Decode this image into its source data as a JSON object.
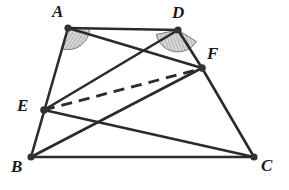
{
  "figure": {
    "type": "geometry-diagram",
    "width": 289,
    "height": 190,
    "background_color": "#ffffff",
    "stroke_color": "#2b2b2b",
    "dot_color": "#333333",
    "angle_mark_fill": "#cccccc",
    "points": [
      {
        "id": "A",
        "label": "A",
        "x": 68,
        "y": 28,
        "label_x": 52,
        "label_y": 3,
        "dot": true
      },
      {
        "id": "D",
        "label": "D",
        "x": 178,
        "y": 30,
        "label_x": 172,
        "label_y": 4,
        "dot": true
      },
      {
        "id": "F",
        "label": "F",
        "x": 202,
        "y": 68,
        "label_x": 207,
        "label_y": 45,
        "dot": true
      },
      {
        "id": "E",
        "label": "E",
        "x": 44,
        "y": 110,
        "label_x": 17,
        "label_y": 97,
        "dot": true
      },
      {
        "id": "B",
        "label": "B",
        "x": 31,
        "y": 157,
        "label_x": 11,
        "label_y": 158,
        "dot": true
      },
      {
        "id": "C",
        "label": "C",
        "x": 254,
        "y": 157,
        "label_x": 261,
        "label_y": 157,
        "dot": true
      }
    ],
    "segments": [
      {
        "id": "AD",
        "from": "A",
        "to": "D",
        "style": "solid"
      },
      {
        "id": "AB",
        "from": "A",
        "to": "B",
        "style": "solid"
      },
      {
        "id": "AF",
        "from": "A",
        "to": "F",
        "style": "solid"
      },
      {
        "id": "DE",
        "from": "D",
        "to": "E",
        "style": "solid"
      },
      {
        "id": "DF",
        "from": "D",
        "to": "F",
        "style": "solid"
      },
      {
        "id": "FC",
        "from": "F",
        "to": "C",
        "style": "solid"
      },
      {
        "id": "BC",
        "from": "B",
        "to": "C",
        "style": "solid"
      },
      {
        "id": "BF",
        "from": "B",
        "to": "F",
        "style": "solid"
      },
      {
        "id": "EC",
        "from": "E",
        "to": "C",
        "style": "solid"
      },
      {
        "id": "EF",
        "from": "E",
        "to": "F",
        "style": "dashed"
      }
    ],
    "angle_marks": [
      {
        "id": "angle-A",
        "vertex": "A",
        "label": "angle at A"
      },
      {
        "id": "angle-D",
        "vertex": "D",
        "label": "angle at D"
      }
    ]
  }
}
